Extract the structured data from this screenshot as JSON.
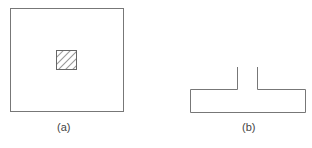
{
  "figure": {
    "panels": [
      {
        "id": "a",
        "label": "(a)",
        "description": "Large square with small hatched square at center"
      },
      {
        "id": "b",
        "label": "(b)",
        "description": "Inverted T-shaped outline (flange with open stem)"
      }
    ],
    "colors": {
      "stroke": "#777777",
      "hatch": "#555555",
      "background": "#ffffff"
    }
  }
}
